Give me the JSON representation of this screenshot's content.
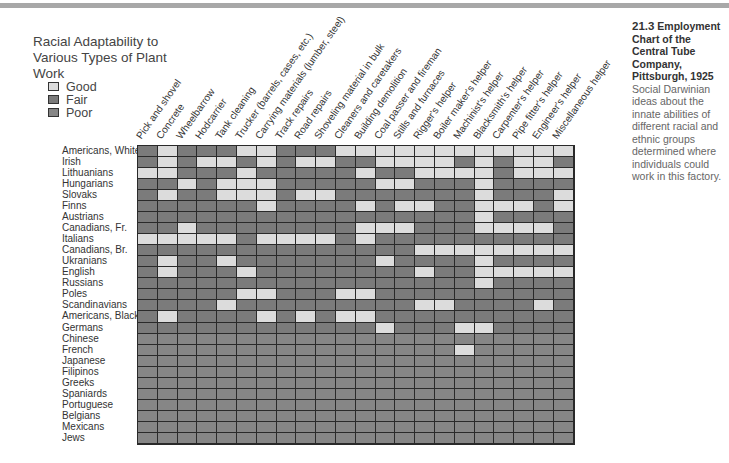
{
  "caption": {
    "figure_number": "21.3",
    "title": "Employment Chart of the Central Tube Company, Pittsburgh, 1925",
    "body": "Social Darwinian ideas about the innate abilities of different racial and ethnic groups determined where individuals could work in this factory."
  },
  "chart_data": {
    "type": "heatmap",
    "title": "Racial Adaptability to Various Types of Plant Work",
    "legend": [
      {
        "key": "G",
        "label": "Good",
        "color": "#dcdcdc"
      },
      {
        "key": "F",
        "label": "Fair",
        "color": "#7b7b7b"
      },
      {
        "key": "P",
        "label": "Poor",
        "color": "#868686"
      }
    ],
    "legend_position": "top-left",
    "columns": [
      "Pick and shovel",
      "Concrete",
      "Wheelbarrow",
      "Hodcarrier",
      "Tank cleaning",
      "Trucker (barrels, cases, etc.)",
      "Carrying materials (lumber, steel)",
      "Track repairs",
      "Road repairs",
      "Shoveling material in bulk",
      "Cleaners and caretakers",
      "Building demolition",
      "Coal passer and fireman",
      "Stills and furnaces",
      "Rigger's helper",
      "Boiler maker's helper",
      "Machinist's helper",
      "Blacksmith's helper",
      "Carpenter's helper",
      "Pipe fitter's helper",
      "Engineer's helper",
      "Miscellaneous helper"
    ],
    "rows": [
      {
        "label": "Americans, White",
        "values": "FGFFFGGFFFGGGGGGGGGGGG"
      },
      {
        "label": "Irish",
        "values": "FGFGGFGFGGFFGGGGFGFGGF"
      },
      {
        "label": "Lithuanians",
        "values": "GGFFFGFFFFFGFFGGGGFGGG"
      },
      {
        "label": "Hungarians",
        "values": "FFGFGGGFFFFFGGFFFGFFFF"
      },
      {
        "label": "Slovaks",
        "values": "FGFFGGGFGGFFFFFFFGFFFG"
      },
      {
        "label": "Finns",
        "values": "FFFFFFGFFFFGFGGFFGGGFG"
      },
      {
        "label": "Austrians",
        "values": "FFFFFFFFFFFFFFFFFGFFFF"
      },
      {
        "label": "Canadians, Fr.",
        "values": "FFGFFFFFFFFGGGFFFGGGGF"
      },
      {
        "label": "Italians",
        "values": "GGGGGFGGGGFGFFFFFFFFFF"
      },
      {
        "label": "Canadians, Br.",
        "values": "FFFFFFFFFFFFFFGGGGGGGG"
      },
      {
        "label": "Ukranians",
        "values": "FGFFGFFFFFFFGFFFFGFFFF"
      },
      {
        "label": "English",
        "values": "FGFFFGFFFFFFFFGFFGGGGG"
      },
      {
        "label": "Russians",
        "values": "FFFFFFFFFFFFFFFFFGFFFF"
      },
      {
        "label": "Poles",
        "values": "FFFFFGGFFFGGFFFFFFFFFF"
      },
      {
        "label": "Scandinavians",
        "values": "FFFFGFFFFFFFFFGGFFFFGF"
      },
      {
        "label": "Americans, Black",
        "values": "FGFFFFGFGFGGFFFFFFFFFF"
      },
      {
        "label": "Germans",
        "values": "FFFFFFFFFFFFGFFFGGFFFF"
      },
      {
        "label": "Chinese",
        "values": "PPPPPPPPPPPPPPPPPPPPPP"
      },
      {
        "label": "French",
        "values": "PPPPPPPPPPPPPPPPGPPPPP"
      },
      {
        "label": "Japanese",
        "values": "PPPPPPPPPPPPPPPPPPPPPP"
      },
      {
        "label": "Filipinos",
        "values": "PPPPPPPPPPPPPPPPPPPPPP"
      },
      {
        "label": "Greeks",
        "values": "PPPPPPPPPPPPPPPPPPPPPP"
      },
      {
        "label": "Spaniards",
        "values": "PPPPPPPPPPPPPPPPPPPPPP"
      },
      {
        "label": "Portuguese",
        "values": "PPPPPPPPPPPPPPPPPPPPPP"
      },
      {
        "label": "Belgians",
        "values": "PPPPPPPPPPPPPPPPPPPPPP"
      },
      {
        "label": "Mexicans",
        "values": "PPPPPPPPPPPPPPPPPPPPPP"
      },
      {
        "label": "Jews",
        "values": "PPPPPPPPPPPPPPPPPPPPPP"
      }
    ]
  }
}
